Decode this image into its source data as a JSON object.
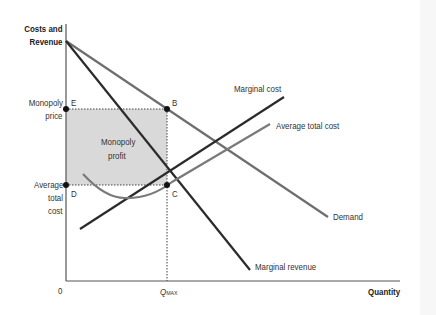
{
  "axes": {
    "y_label_line1": "Costs and",
    "y_label_line2": "Revenue",
    "x_label": "Quantity",
    "origin_label": "0",
    "qmax_label_main": "Q",
    "qmax_label_sub": "MAX"
  },
  "price_labels": {
    "monopoly_price_line1": "Monopoly",
    "monopoly_price_line2": "price",
    "atc_line1": "Average",
    "atc_line2": "total",
    "atc_line3": "cost"
  },
  "points": {
    "E": "E",
    "B": "B",
    "D": "D",
    "C": "C"
  },
  "region": {
    "profit_line1": "Monopoly",
    "profit_line2": "profit"
  },
  "curves": {
    "marginal_cost": "Marginal cost",
    "average_total_cost": "Average total cost",
    "demand": "Demand",
    "marginal_revenue": "Marginal revenue"
  },
  "colors": {
    "axis": "#555555",
    "demand": "#6e6e6e",
    "marginal_revenue": "#2b2b2b",
    "marginal_cost": "#2b2b2b",
    "average_total_cost": "#7a7a7a",
    "profit_fill": "#d9d9d9",
    "dot": "#111111"
  }
}
